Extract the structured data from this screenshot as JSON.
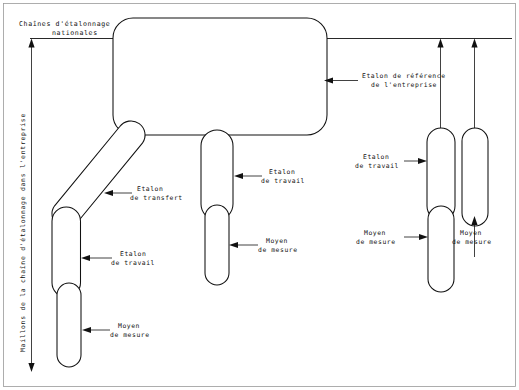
{
  "diagram": {
    "title_top": "Chaînes d'étalonnage",
    "title_top_line2": "nationales",
    "axis_label": "Maillons de la chaîne d'étalonnage dans l'entreprise",
    "labels": {
      "reference_std_l1": "Etalon de référence",
      "reference_std_l2": "de l'entreprise",
      "transfer_std_l1": "Etalon",
      "transfer_std_l2": "de transfert",
      "working_std_left_l1": "Etalon",
      "working_std_left_l2": "de travail",
      "measuring_means_left_l1": "Moyen",
      "measuring_means_left_l2": "de mesure",
      "working_std_mid_l1": "Etalon",
      "working_std_mid_l2": "de travail",
      "measuring_means_mid_l1": "Moyen",
      "measuring_means_mid_l2": "de mesure",
      "working_std_right_l1": "Etalon",
      "working_std_right_l2": "de travail",
      "measuring_means_right_l1": "Moyen",
      "measuring_means_right_l2": "de mesure",
      "measuring_means_far_right_l1": "Moyen",
      "measuring_means_far_right_l2": "de mesure"
    },
    "colors": {
      "ink": "#111111",
      "frame": "#9a9a9a",
      "paper": "#ffffff"
    }
  }
}
